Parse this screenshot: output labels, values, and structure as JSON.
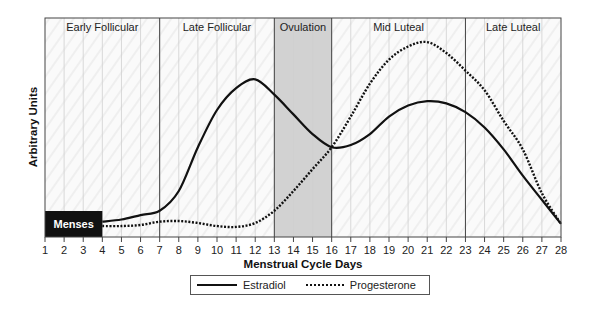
{
  "chart_data": {
    "type": "line",
    "title": "",
    "xlabel": "Menstrual Cycle Days",
    "ylabel": "Arbitrary Units",
    "xlim": [
      1,
      28
    ],
    "ylim": [
      0,
      100
    ],
    "x_ticks": [
      "1",
      "2",
      "3",
      "4",
      "5",
      "6",
      "7",
      "8",
      "9",
      "10",
      "11",
      "12",
      "13",
      "14",
      "15",
      "16",
      "17",
      "18",
      "19",
      "20",
      "21",
      "22",
      "23",
      "24",
      "25",
      "26",
      "27",
      "28"
    ],
    "grid": true,
    "phases": [
      {
        "name": "Early Follicular",
        "start": 1,
        "end": 7,
        "shaded": false
      },
      {
        "name": "Late Follicular",
        "start": 7,
        "end": 13,
        "shaded": false
      },
      {
        "name": "Ovulation",
        "start": 13,
        "end": 16,
        "shaded": true
      },
      {
        "name": "Mid Luteal",
        "start": 16,
        "end": 23,
        "shaded": false
      },
      {
        "name": "Late Luteal",
        "start": 23,
        "end": 28,
        "shaded": false
      }
    ],
    "annotations": [
      {
        "text": "Menses",
        "start": 1,
        "end": 4
      }
    ],
    "x": [
      4,
      5,
      6,
      7,
      8,
      9,
      10,
      11,
      12,
      13,
      14,
      15,
      16,
      17,
      18,
      19,
      20,
      21,
      22,
      23,
      24,
      25,
      26,
      27,
      28
    ],
    "series": [
      {
        "name": "Estradiol",
        "style": "solid",
        "values": [
          7,
          8,
          10,
          12,
          21,
          41,
          58,
          68,
          72,
          65,
          56,
          47,
          41,
          42,
          47,
          55,
          60,
          62,
          61,
          57,
          50,
          40,
          28,
          17,
          6
        ]
      },
      {
        "name": "Progesterone",
        "style": "dotted",
        "values": [
          5,
          5,
          5.5,
          7,
          7.3,
          6.4,
          5,
          4.6,
          6.4,
          12,
          21,
          31,
          41,
          55,
          70,
          81,
          87,
          89,
          84,
          76,
          67,
          53,
          40,
          20,
          6
        ]
      }
    ],
    "legend_position": "bottom-center"
  },
  "colors": {
    "line": "#111111",
    "ovulation_band": "#d2d2d2",
    "menses_box": "#111111",
    "grid": "#cfcfcf",
    "border": "#444444"
  }
}
